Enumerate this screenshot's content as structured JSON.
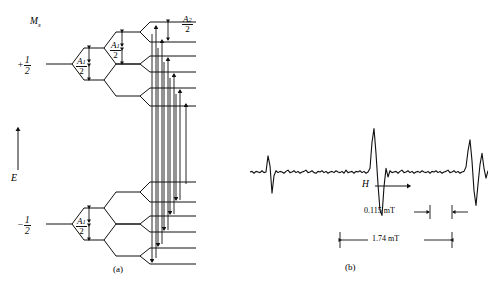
{
  "figure": {
    "panel_a": {
      "caption": "(a)",
      "axis_label": "E",
      "quantum_number_label": "M",
      "quantum_number_sub": "s",
      "levels": [
        {
          "sign": "+",
          "num": "1",
          "den": "2"
        },
        {
          "sign": "−",
          "num": "1",
          "den": "2"
        }
      ],
      "splitting_labels": [
        {
          "symbol": "A",
          "sub": "1",
          "den": "2"
        },
        {
          "symbol": "A",
          "sub": "1",
          "den": "2"
        },
        {
          "symbol": "A",
          "sub": "2",
          "den": "2"
        },
        {
          "symbol": "A",
          "sub": "1",
          "den": "2"
        }
      ]
    },
    "panel_b": {
      "caption": "(b)",
      "field_axis_label": "H",
      "measurements": [
        {
          "value": "0.115 mT"
        },
        {
          "value": "1.74 mT"
        }
      ]
    }
  },
  "chart_data": {
    "type": "line",
    "title": "",
    "xlabel": "H",
    "ylabel": "",
    "grid": false,
    "legend": null,
    "annotations": [
      "0.115 mT",
      "1.74 mT"
    ],
    "x": [
      0,
      2,
      4,
      6,
      8,
      10,
      12,
      14,
      16,
      18,
      20,
      22,
      24,
      26,
      28,
      30,
      32,
      34,
      36,
      38,
      40,
      42,
      44,
      46,
      48,
      50,
      52,
      54,
      56,
      58,
      60,
      62,
      64,
      66,
      68,
      70,
      72,
      74,
      76,
      78,
      80,
      82,
      84,
      86,
      88,
      90,
      92,
      94,
      96,
      98,
      100,
      102,
      104,
      106,
      108,
      110,
      112,
      114,
      116,
      118,
      120,
      122,
      124,
      126,
      128,
      130,
      132,
      134,
      136,
      138,
      140,
      142,
      144,
      146,
      148,
      150,
      152,
      154,
      156,
      158,
      160,
      162,
      164,
      166,
      168,
      170,
      172,
      174,
      176,
      178,
      180,
      182,
      184,
      186,
      188,
      190,
      192,
      194,
      196,
      198,
      200,
      202,
      204,
      206,
      208,
      210,
      212,
      214,
      216,
      218,
      220,
      222,
      224,
      226,
      228,
      230,
      232,
      234,
      236,
      238
    ],
    "y": [
      0,
      1,
      -2,
      1,
      0,
      -1,
      2,
      -1,
      0,
      26,
      10,
      -34,
      -6,
      2,
      -1,
      1,
      0,
      -2,
      1,
      3,
      -1,
      0,
      2,
      -1,
      1,
      -2,
      0,
      1,
      3,
      -1,
      0,
      2,
      -1,
      -2,
      1,
      0,
      2,
      -1,
      1,
      -2,
      0,
      1,
      -1,
      2,
      0,
      -1,
      1,
      -2,
      3,
      -1,
      0,
      1,
      -2,
      1,
      0,
      2,
      -1,
      1,
      -2,
      0,
      6,
      48,
      70,
      30,
      -20,
      -62,
      -70,
      -24,
      6,
      -8,
      2,
      -1,
      0,
      1,
      -2,
      1,
      3,
      -1,
      0,
      2,
      -1,
      1,
      -2,
      0,
      1,
      -1,
      2,
      0,
      -1,
      1,
      -2,
      1,
      0,
      2,
      -1,
      1,
      -2,
      0,
      1,
      3,
      -1,
      0,
      2,
      -1,
      1,
      -2,
      0,
      1,
      8,
      34,
      52,
      18,
      -30,
      -54,
      -20,
      12,
      30,
      6,
      -10,
      2,
      4,
      -2,
      1,
      0,
      -1,
      1,
      0,
      -1,
      0
    ]
  }
}
